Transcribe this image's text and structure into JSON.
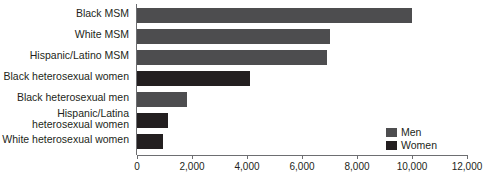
{
  "chart_data": {
    "type": "bar",
    "orientation": "horizontal",
    "title": "",
    "xlabel": "",
    "ylabel": "",
    "xlim": [
      0,
      12000
    ],
    "xticks": [
      0,
      2000,
      4000,
      6000,
      8000,
      10000,
      12000
    ],
    "xticklabels": [
      "0",
      "2,000",
      "4,000",
      "6,000",
      "8,000",
      "10,000",
      "12,000"
    ],
    "grid": false,
    "legend_position": "inside-right",
    "categories": [
      "Black MSM",
      "White MSM",
      "Hispanic/Latino MSM",
      "Black heterosexual women",
      "Black heterosexual men",
      "Hispanic/Latina\nheterosexual women",
      "White heterosexual women"
    ],
    "values": [
      10000,
      7000,
      6900,
      4100,
      1820,
      1140,
      930
    ],
    "groups": [
      "Men",
      "Men",
      "Men",
      "Women",
      "Men",
      "Women",
      "Women"
    ],
    "series": [
      {
        "name": "Men",
        "color": "#4d4d4f"
      },
      {
        "name": "Women",
        "color": "#231f20"
      }
    ],
    "legend": [
      {
        "label": "Men",
        "color": "#4d4d4f"
      },
      {
        "label": "Women",
        "color": "#231f20"
      }
    ]
  },
  "colors": {
    "men": "#4d4d4f",
    "women": "#231f20",
    "axis": "#6d6e71",
    "background": "#ffffff"
  }
}
